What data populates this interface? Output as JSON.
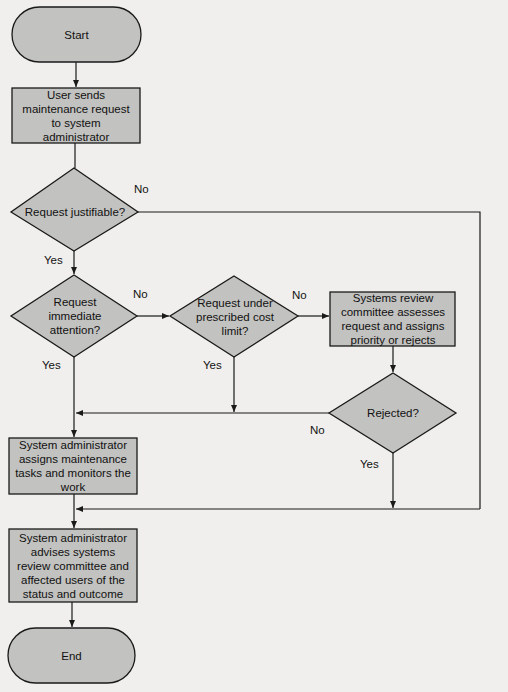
{
  "diagram": {
    "type": "flowchart",
    "colors": {
      "shape_fill": "#c2c2c0",
      "stroke": "#1a1a1a",
      "background": "#f0efed"
    },
    "nodes": {
      "start": {
        "shape": "terminator",
        "label": "Start"
      },
      "user_request": {
        "shape": "process",
        "label": "User sends maintenance request to system administrator"
      },
      "justifiable": {
        "shape": "decision",
        "label": "Request justifiable?"
      },
      "immediate": {
        "shape": "decision",
        "label": "Request immediate attention?"
      },
      "cost_limit": {
        "shape": "decision",
        "label": "Request under prescribed cost limit?"
      },
      "committee": {
        "shape": "process",
        "label": "Systems review committee assesses request and assigns priority or rejects"
      },
      "rejected": {
        "shape": "decision",
        "label": "Rejected?"
      },
      "assign": {
        "shape": "process",
        "label": "System administrator assigns maintenance tasks and monitors the work"
      },
      "advise": {
        "shape": "process",
        "label": "System administrator advises systems review committee and affected users of the status and outcome"
      },
      "end": {
        "shape": "terminator",
        "label": "End"
      }
    },
    "edge_labels": {
      "justifiable_no": "No",
      "justifiable_yes": "Yes",
      "immediate_no": "No",
      "immediate_yes": "Yes",
      "cost_no": "No",
      "cost_yes": "Yes",
      "rejected_no": "No",
      "rejected_yes": "Yes"
    },
    "edges": [
      {
        "from": "start",
        "to": "user_request"
      },
      {
        "from": "user_request",
        "to": "justifiable"
      },
      {
        "from": "justifiable",
        "to": "advise",
        "label": "No"
      },
      {
        "from": "justifiable",
        "to": "immediate",
        "label": "Yes"
      },
      {
        "from": "immediate",
        "to": "cost_limit",
        "label": "No"
      },
      {
        "from": "immediate",
        "to": "assign",
        "label": "Yes"
      },
      {
        "from": "cost_limit",
        "to": "committee",
        "label": "No"
      },
      {
        "from": "cost_limit",
        "to": "assign",
        "label": "Yes"
      },
      {
        "from": "committee",
        "to": "rejected"
      },
      {
        "from": "rejected",
        "to": "assign",
        "label": "No"
      },
      {
        "from": "rejected",
        "to": "advise",
        "label": "Yes"
      },
      {
        "from": "assign",
        "to": "advise"
      },
      {
        "from": "advise",
        "to": "end"
      }
    ]
  }
}
